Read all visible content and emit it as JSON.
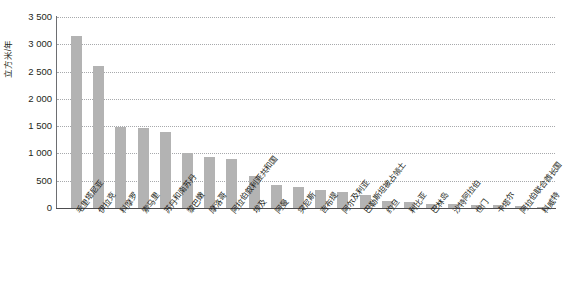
{
  "chart_data": {
    "type": "bar",
    "title": "",
    "subtitle": "",
    "xlabel": "",
    "ylabel": "立方米/年",
    "ylim": [
      0,
      3500
    ],
    "yticks": [
      0,
      500,
      1000,
      1500,
      2000,
      2500,
      3000,
      3500
    ],
    "ytick_labels": [
      "0",
      "500",
      "1 000",
      "1 500",
      "2 000",
      "2 500",
      "3 000",
      "3 500"
    ],
    "grid": true,
    "legend": false,
    "legend_position": "none",
    "bar_color": "#b3b3b3",
    "categories": [
      "毛里塔尼亚",
      "伊拉克",
      "科摩罗",
      "索马里",
      "苏丹和南苏丹",
      "黎巴嫩",
      "摩洛哥",
      "阿拉伯叙利亚共和国",
      "埃及",
      "阿曼",
      "突尼斯",
      "吉布提",
      "阿尔及利亚",
      "巴勒斯坦被占领土",
      "约旦",
      "利比亚",
      "巴林岛",
      "沙特阿拉伯",
      "也门",
      "卡塔尔",
      "阿拉伯联合酋长国",
      "科威特"
    ],
    "values": [
      3150,
      2600,
      1480,
      1460,
      1400,
      1000,
      940,
      900,
      580,
      420,
      390,
      330,
      290,
      240,
      130,
      105,
      80,
      70,
      60,
      55,
      45,
      20
    ]
  },
  "axis": {
    "y_title": "立方米/年"
  }
}
